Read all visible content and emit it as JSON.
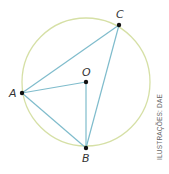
{
  "diagram": {
    "type": "inscribed-angle-geometry",
    "circle": {
      "cx": 86,
      "cy": 82,
      "r": 64,
      "stroke": "#d6e0a6"
    },
    "line_color": "#7fbccc",
    "points": [
      {
        "name": "C",
        "x": 119,
        "y": 25,
        "label": "C",
        "lx": 116,
        "ly": 18
      },
      {
        "name": "O",
        "x": 86,
        "y": 82,
        "label": "O",
        "lx": 82,
        "ly": 76
      },
      {
        "name": "A",
        "x": 22,
        "y": 93,
        "label": "A",
        "lx": 10,
        "ly": 97
      },
      {
        "name": "B",
        "x": 86,
        "y": 148,
        "label": "B",
        "lx": 82,
        "ly": 161
      }
    ],
    "segments": [
      [
        "A",
        "C"
      ],
      [
        "C",
        "B"
      ],
      [
        "A",
        "B"
      ],
      [
        "A",
        "O"
      ],
      [
        "O",
        "B"
      ]
    ],
    "labels": {
      "C": "C",
      "O": "O",
      "A": "A",
      "B": "B"
    },
    "credit": "ILUSTRAÇÕES: DAE"
  }
}
